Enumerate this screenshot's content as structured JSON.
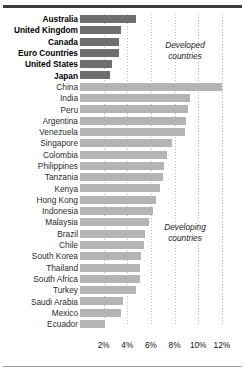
{
  "chart_data": {
    "type": "bar",
    "orientation": "horizontal",
    "title": "",
    "xlabel": "",
    "ylabel": "",
    "xlim": [
      0,
      12.8
    ],
    "grid": true,
    "xticks": [
      2,
      4,
      6,
      8,
      10,
      12
    ],
    "xtick_labels": [
      "2%",
      "4%",
      "6%",
      "8%",
      "10%",
      "12%"
    ],
    "annotations": [
      {
        "text_line1": "Developed",
        "text_line2": "countries"
      },
      {
        "text_line1": "Developing",
        "text_line2": "countries"
      }
    ],
    "series": [
      {
        "name": "Developed countries",
        "color": "#6e6e6e"
      },
      {
        "name": "Developing countries",
        "color": "#b4b4b4"
      }
    ],
    "categories": [
      "Australia",
      "United Kingdom",
      "Canada",
      "Euro Countries",
      "United States",
      "Japan",
      "China",
      "India",
      "Peru",
      "Argentina",
      "Venezuela",
      "Singapore",
      "Colombia",
      "Philippines",
      "Tanzania",
      "Kenya",
      "Hong Kong",
      "Indonesia",
      "Malaysia",
      "Brazil",
      "Chile",
      "South Korea",
      "Thailand",
      "South Africa",
      "Turkey",
      "Saudi Arabia",
      "Mexico",
      "Ecuador"
    ],
    "values": [
      4.7,
      3.5,
      3.3,
      3.3,
      2.7,
      2.5,
      12.0,
      9.3,
      9.1,
      9.0,
      8.9,
      7.8,
      7.4,
      7.1,
      7.0,
      6.8,
      6.4,
      6.2,
      5.8,
      5.5,
      5.4,
      5.2,
      5.1,
      5.1,
      4.7,
      3.6,
      3.5,
      2.1
    ],
    "groups": [
      "developed",
      "developed",
      "developed",
      "developed",
      "developed",
      "developed",
      "developing",
      "developing",
      "developing",
      "developing",
      "developing",
      "developing",
      "developing",
      "developing",
      "developing",
      "developing",
      "developing",
      "developing",
      "developing",
      "developing",
      "developing",
      "developing",
      "developing",
      "developing",
      "developing",
      "developing",
      "developing",
      "developing"
    ]
  },
  "colors": {
    "developed_bar": "#6e6e6e",
    "developing_bar": "#b4b4b4",
    "gridline": "#b9b9b9",
    "rule": "#3b3b3b",
    "text": "#111111"
  }
}
